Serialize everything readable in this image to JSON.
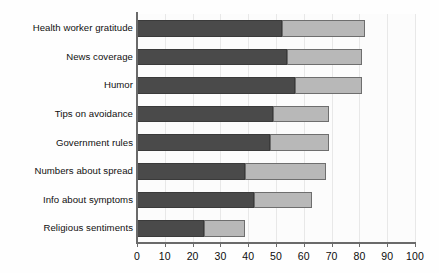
{
  "chart_data": {
    "type": "bar",
    "orientation": "horizontal",
    "stacked": true,
    "title": "",
    "subtitle": "",
    "xlabel": "",
    "ylabel": "",
    "xlim": [
      0,
      100
    ],
    "ylim": null,
    "grid": true,
    "grid_axis": "x",
    "legend": null,
    "legend_position": "none",
    "xticks": [
      0,
      10,
      20,
      30,
      40,
      50,
      60,
      70,
      80,
      90,
      100
    ],
    "xticklabels": [
      "0",
      "10",
      "20",
      "30",
      "40",
      "50",
      "60",
      "70",
      "80",
      "90",
      "100"
    ],
    "categories": [
      "Health worker gratitude",
      "News coverage",
      "Humor",
      "Tips on avoidance",
      "Government rules",
      "Numbers about spread",
      "Info about symptoms",
      "Religious sentiments"
    ],
    "series": [
      {
        "name": "segment-1",
        "color": "#4a4a4a",
        "values": [
          52,
          54,
          57,
          49,
          48,
          39,
          42,
          24
        ]
      },
      {
        "name": "segment-2",
        "color": "#b8b8b8",
        "values": [
          30,
          27,
          24,
          20,
          21,
          29,
          21,
          15
        ]
      }
    ],
    "totals": [
      82,
      81,
      81,
      69,
      69,
      68,
      63,
      39
    ]
  },
  "style": {
    "bar_dark": "#4a4a4a",
    "bar_light": "#b8b8b8",
    "bar_outline": "#5f5f5f",
    "axis_color": "#6a6a6a",
    "grid_color": "#e8e8e8",
    "text_color": "#101010",
    "plot_background": "#fcfcfc",
    "page_background": "#ffffff"
  }
}
